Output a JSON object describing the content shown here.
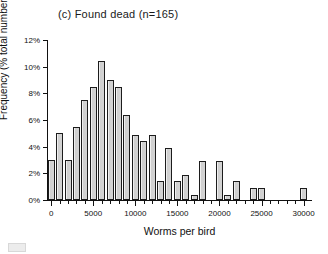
{
  "figure": {
    "panel_label": "(c)",
    "title": "(c) Found dead (n=165)",
    "xlabel": "Worms per bird",
    "ylabel": "Frequency (% total number of birds)"
  },
  "axes": {
    "y_ticks": [
      "0%",
      "2%",
      "4%",
      "6%",
      "8%",
      "10%",
      "12%"
    ],
    "x_ticks": [
      "0",
      "5000",
      "10000",
      "15000",
      "20000",
      "25000",
      "30000"
    ]
  },
  "chart_data": {
    "type": "bar",
    "title": "(c) Found dead (n=165)",
    "xlabel": "Worms per bird",
    "ylabel": "Frequency (% total number of birds)",
    "sample_size": 165,
    "bin_width": 1000,
    "xlim": [
      -500,
      31000
    ],
    "ylim": [
      0,
      12
    ],
    "grid": false,
    "legend": "none",
    "ytick_values": [
      0,
      2,
      4,
      6,
      8,
      10,
      12
    ],
    "ytick_labels": [
      "0%",
      "2%",
      "4%",
      "6%",
      "8%",
      "10%",
      "12%"
    ],
    "xtick_values": [
      0,
      5000,
      10000,
      15000,
      20000,
      25000,
      30000
    ],
    "xtick_labels": [
      "0",
      "5000",
      "10000",
      "15000",
      "20000",
      "25000",
      "30000"
    ],
    "x_minor_tick_interval": 1000,
    "categories": [
      "0",
      "1000",
      "2000",
      "3000",
      "4000",
      "5000",
      "6000",
      "7000",
      "8000",
      "9000",
      "10000",
      "11000",
      "12000",
      "13000",
      "14000",
      "15000",
      "16000",
      "17000",
      "18000",
      "19000",
      "20000",
      "21000",
      "22000",
      "23000",
      "24000",
      "25000",
      "26000",
      "27000",
      "28000",
      "29000",
      "30000"
    ],
    "values": [
      3.0,
      5.0,
      3.0,
      5.5,
      7.5,
      8.5,
      10.4,
      9.0,
      8.5,
      6.4,
      4.9,
      4.4,
      4.9,
      1.4,
      3.9,
      1.4,
      1.9,
      0.4,
      2.9,
      0.0,
      2.9,
      0.4,
      1.4,
      0.0,
      0.9,
      0.9,
      0.0,
      0.0,
      0.0,
      0.0,
      0.9
    ]
  }
}
